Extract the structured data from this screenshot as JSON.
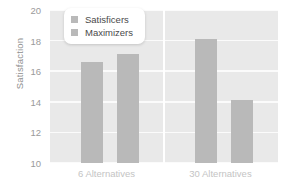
{
  "chart_data": {
    "type": "bar",
    "title": "",
    "xlabel": "",
    "ylabel": "Satisfaction",
    "categories": [
      "6 Alternatives",
      "30 Alternatives"
    ],
    "series": [
      {
        "name": "Satisficers",
        "values": [
          16.6,
          18.1
        ],
        "color": "#b9b9b9"
      },
      {
        "name": "Maximizers",
        "values": [
          17.1,
          14.1
        ],
        "color": "#b9b9b9"
      }
    ],
    "ylim": [
      10,
      20
    ],
    "yticks": [
      10,
      12,
      14,
      16,
      18,
      20
    ],
    "ytick_labels": [
      "10",
      "12",
      "14",
      "16",
      "18",
      "20"
    ],
    "grid": true,
    "legend_position": "top-left",
    "plot_background": "#e9e9e9",
    "gridline_color": "#fbfbfb"
  },
  "axis": {
    "y_title": "Satisfaction"
  },
  "legend": {
    "entries": [
      {
        "label": "Satisficers",
        "swatch_color": "#b9b9b9"
      },
      {
        "label": "Maximizers",
        "swatch_color": "#b9b9b9"
      }
    ]
  }
}
